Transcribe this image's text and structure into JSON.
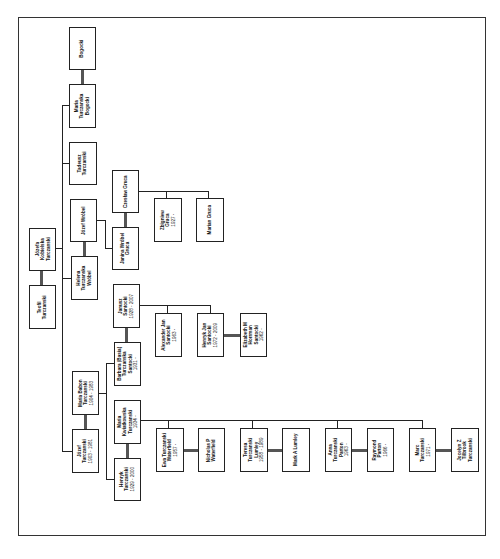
{
  "people": {
    "teofil": {
      "name": "Teofil\nTurczanski",
      "dates": ""
    },
    "jozefa": {
      "name": "Józefa\nKobielska\nTurczanski",
      "dates": ""
    },
    "bogocki": {
      "name": "Bogocki",
      "dates": ""
    },
    "maria_bogocki": {
      "name": "Maria\nTurczanska\nBogocki",
      "dates": ""
    },
    "tadeusz": {
      "name": "Tadeusz\nTurczanski",
      "dates": ""
    },
    "jozef_wrobel": {
      "name": "Józef Wróbel",
      "dates": ""
    },
    "helena": {
      "name": "Helena\nTurczanska\nWróbel",
      "dates": ""
    },
    "maria_babon": {
      "name": "Maria Babon\nTurczanski",
      "dates": "1904 - 1983"
    },
    "jozef_t": {
      "name": "Józef\nTurczanski",
      "dates": "1903 - 1981"
    },
    "czeslaw": {
      "name": "Czesław Gruca",
      "dates": ""
    },
    "janina": {
      "name": "Janina Wróbel\nGruca",
      "dates": ""
    },
    "janusz": {
      "name": "Janusz\nSantocki",
      "dates": "1928 - 2007"
    },
    "barbara": {
      "name": "Barbara (Basia)\nTurczanska\nSantocki",
      "dates": "1931 -"
    },
    "maria_kw": {
      "name": "Maria\nKwiatkowska\nTurczanski",
      "dates": "1934 -"
    },
    "henryk": {
      "name": "Henryk\nTurczanski",
      "dates": "1929 - 2000"
    },
    "zbigniew": {
      "name": "Zbigniew\nGruca",
      "dates": "1927 -"
    },
    "marian": {
      "name": "Marian Gruca",
      "dates": ""
    },
    "alexander": {
      "name": "Alexander Jan\nSantocki",
      "dates": "1963 -"
    },
    "henryk_jan": {
      "name": "Henryk Jan\nSantocki",
      "dates": "1972 - 2009"
    },
    "elizabeth": {
      "name": "Elizabeth M\nHorrman\nSantocki",
      "dates": "1962 -"
    },
    "ewa": {
      "name": "Ewa Turczanski\nWaterfield",
      "dates": "1957 -"
    },
    "nicholas": {
      "name": "Nicholas P\nWaterfield",
      "dates": ""
    },
    "teresa": {
      "name": "Teresa\nTurczanski\nLumley",
      "dates": "1958 - 1989"
    },
    "mark": {
      "name": "Mark A Lumley",
      "dates": ""
    },
    "anna": {
      "name": "Anna\nTurczanski\nParton",
      "dates": "1963 -"
    },
    "raymond": {
      "name": "Raymond\nParton",
      "dates": "1966 -"
    },
    "marc": {
      "name": "Marc\nTurczanski",
      "dates": "1971 -"
    },
    "jocelyn": {
      "name": "Jocelyn Z\nTilbrook\nTurczanski",
      "dates": ""
    }
  }
}
